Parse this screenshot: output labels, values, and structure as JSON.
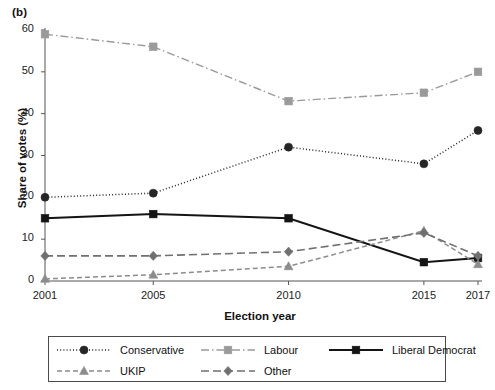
{
  "panel_label": "(b)",
  "chart_data": {
    "type": "line",
    "title": "",
    "xlabel": "Election year",
    "ylabel": "Share of votes (%)",
    "x": [
      2001,
      2005,
      2010,
      2015,
      2017
    ],
    "categories": [
      "2001",
      "2005",
      "2010",
      "2015",
      "2017"
    ],
    "xlim": [
      2001,
      2017
    ],
    "ylim": [
      0,
      60
    ],
    "yticks": [
      0,
      10,
      20,
      30,
      40,
      50,
      60
    ],
    "ytick_labels": [
      "0",
      "10",
      "20",
      "30",
      "40",
      "50",
      "60"
    ],
    "xtick_labels": [
      "2001",
      "2005",
      "2010",
      "2015",
      "2017"
    ],
    "grid": false,
    "legend_position": "below-axes",
    "series": [
      {
        "name": "Conservative",
        "values": [
          20,
          21,
          32,
          28,
          36
        ],
        "color": "#262626",
        "marker": "circle",
        "linestyle": "dotted"
      },
      {
        "name": "Labour",
        "values": [
          59,
          56,
          43,
          45,
          50
        ],
        "color": "#9a9a9a",
        "marker": "square",
        "linestyle": "dashdot"
      },
      {
        "name": "Liberal Democrat",
        "values": [
          15,
          16,
          15,
          4.5,
          5.5
        ],
        "color": "#141414",
        "marker": "square",
        "linestyle": "solid"
      },
      {
        "name": "UKIP",
        "values": [
          0.5,
          1.5,
          3.5,
          12,
          4
        ],
        "color": "#8c8c8c",
        "marker": "triangle",
        "linestyle": "dashed"
      },
      {
        "name": "Other",
        "values": [
          6,
          6,
          7,
          11.5,
          6
        ],
        "color": "#707070",
        "marker": "diamond",
        "linestyle": "longdash"
      }
    ]
  },
  "legend": {
    "entries": [
      {
        "label": "Conservative"
      },
      {
        "label": "Labour"
      },
      {
        "label": "Liberal Democrat"
      },
      {
        "label": "UKIP"
      },
      {
        "label": "Other"
      }
    ]
  }
}
